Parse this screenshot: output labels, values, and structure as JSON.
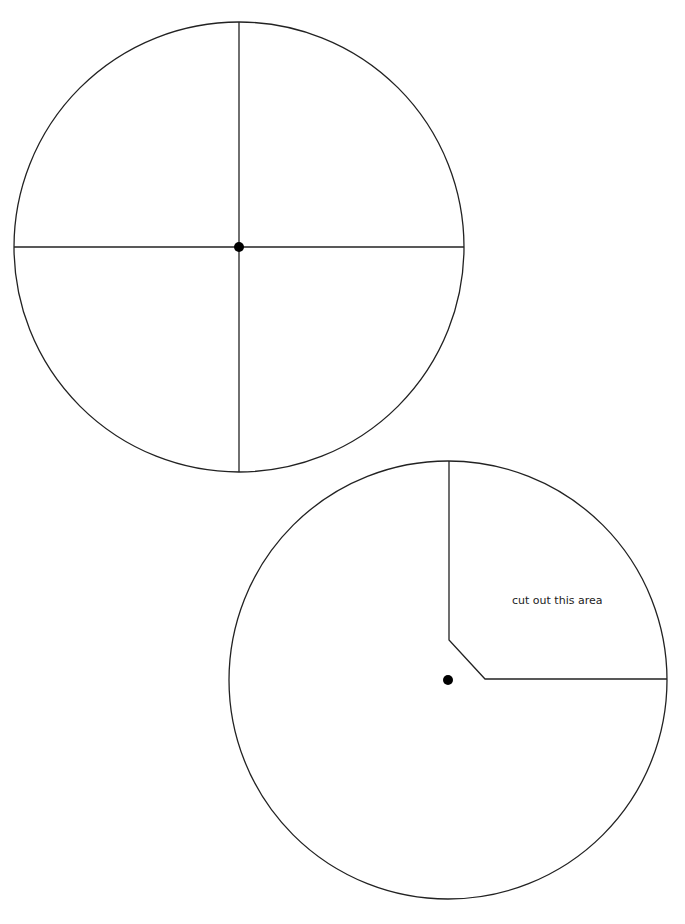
{
  "diagram": {
    "colors": {
      "stroke": "#222222",
      "dot": "#000000",
      "background": "#ffffff"
    },
    "disc_top": {
      "description": "circle divided into four quadrants with center pin",
      "center": [
        239,
        247
      ],
      "radius": 225
    },
    "disc_bottom": {
      "description": "circle with upper-right quadrant cutout and center pin",
      "center": [
        448,
        680
      ],
      "radius": 219,
      "cutout_label": "cut out this area"
    }
  }
}
